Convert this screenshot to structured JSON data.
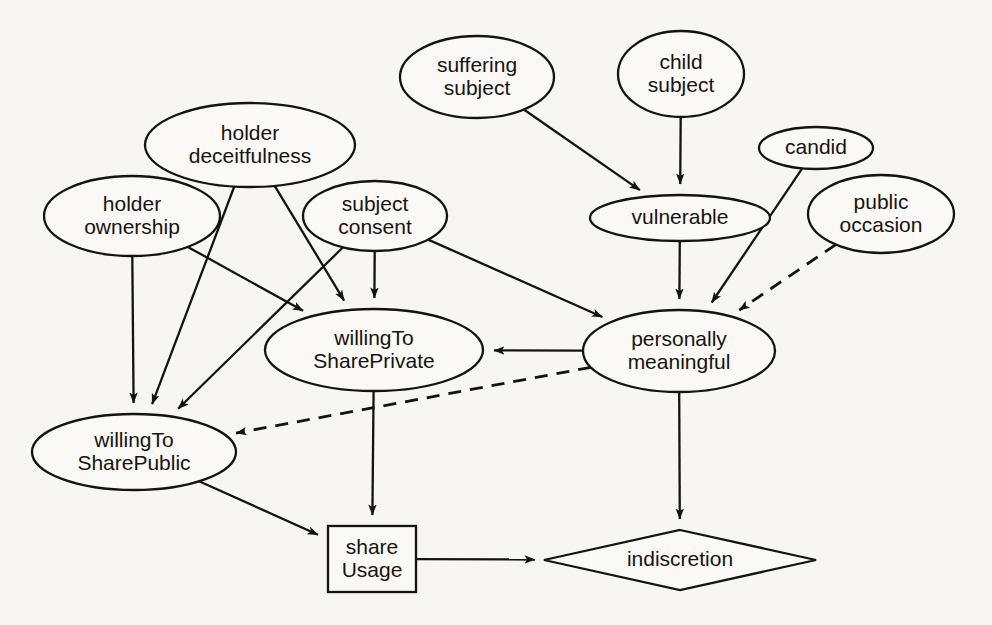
{
  "diagram": {
    "background_color": "#f7f6f3",
    "stroke_color": "#16130f",
    "node_fill": "#faf9f6",
    "nodes": [
      {
        "id": "suffering_subject",
        "label_lines": [
          "suffering",
          "subject"
        ],
        "shape": "ellipse",
        "cx": 477,
        "cy": 77,
        "rx": 77,
        "ry": 41
      },
      {
        "id": "child_subject",
        "label_lines": [
          "child",
          "subject"
        ],
        "shape": "ellipse",
        "cx": 681,
        "cy": 74,
        "rx": 63,
        "ry": 43
      },
      {
        "id": "holder_deceitfulness",
        "label_lines": [
          "holder",
          "deceitfulness"
        ],
        "shape": "ellipse",
        "cx": 250,
        "cy": 145,
        "rx": 105,
        "ry": 42
      },
      {
        "id": "candid",
        "label_lines": [
          "candid"
        ],
        "shape": "ellipse",
        "cx": 816,
        "cy": 148,
        "rx": 57,
        "ry": 21
      },
      {
        "id": "holder_ownership",
        "label_lines": [
          "holder",
          "ownership"
        ],
        "shape": "ellipse",
        "cx": 132,
        "cy": 216,
        "rx": 88,
        "ry": 40
      },
      {
        "id": "subject_consent",
        "label_lines": [
          "subject",
          "consent"
        ],
        "shape": "ellipse",
        "cx": 375,
        "cy": 216,
        "rx": 72,
        "ry": 35
      },
      {
        "id": "vulnerable",
        "label_lines": [
          "vulnerable"
        ],
        "shape": "ellipse",
        "cx": 680,
        "cy": 218,
        "rx": 90,
        "ry": 23
      },
      {
        "id": "public_occasion",
        "label_lines": [
          "public",
          "occasion"
        ],
        "shape": "ellipse",
        "cx": 881,
        "cy": 214,
        "rx": 73,
        "ry": 39
      },
      {
        "id": "willing_share_private",
        "label_lines": [
          "willingTo",
          "SharePrivate"
        ],
        "shape": "ellipse",
        "cx": 374,
        "cy": 350,
        "rx": 109,
        "ry": 41
      },
      {
        "id": "personally_meaningful",
        "label_lines": [
          "personally",
          "meaningful"
        ],
        "shape": "ellipse",
        "cx": 679,
        "cy": 351,
        "rx": 96,
        "ry": 41
      },
      {
        "id": "willing_share_public",
        "label_lines": [
          "willingTo",
          "SharePublic"
        ],
        "shape": "ellipse",
        "cx": 134,
        "cy": 452,
        "rx": 102,
        "ry": 38
      },
      {
        "id": "share_usage",
        "label_lines": [
          "share",
          "Usage"
        ],
        "shape": "rect",
        "cx": 372,
        "cy": 559,
        "rx": 44,
        "ry": 33
      },
      {
        "id": "indiscretion",
        "label_lines": [
          "indiscretion"
        ],
        "shape": "diamond",
        "cx": 680,
        "cy": 560,
        "rx": 136,
        "ry": 30
      }
    ],
    "edges": [
      {
        "from": "suffering_subject",
        "to": "vulnerable",
        "style": "solid",
        "arrow": true
      },
      {
        "from": "child_subject",
        "to": "vulnerable",
        "style": "solid",
        "arrow": true
      },
      {
        "from": "vulnerable",
        "to": "personally_meaningful",
        "style": "solid",
        "arrow": true
      },
      {
        "from": "candid",
        "to": "personally_meaningful",
        "style": "solid",
        "arrow": true
      },
      {
        "from": "public_occasion",
        "to": "personally_meaningful",
        "style": "dashed",
        "arrow": true
      },
      {
        "from": "holder_deceitfulness",
        "to": "willing_share_private",
        "style": "solid",
        "arrow": true
      },
      {
        "from": "holder_deceitfulness",
        "to": "willing_share_public",
        "style": "solid",
        "arrow": true
      },
      {
        "from": "holder_ownership",
        "to": "willing_share_public",
        "style": "solid",
        "arrow": true
      },
      {
        "from": "holder_ownership",
        "to": "willing_share_private",
        "style": "solid",
        "arrow": true
      },
      {
        "from": "subject_consent",
        "to": "willing_share_private",
        "style": "solid",
        "arrow": true
      },
      {
        "from": "subject_consent",
        "to": "willing_share_public",
        "style": "solid",
        "arrow": true
      },
      {
        "from": "subject_consent",
        "to": "personally_meaningful",
        "style": "solid",
        "arrow": true
      },
      {
        "from": "personally_meaningful",
        "to": "willing_share_private",
        "style": "solid",
        "arrow": true
      },
      {
        "from": "personally_meaningful",
        "to": "willing_share_public",
        "style": "dashed",
        "arrow": true
      },
      {
        "from": "personally_meaningful",
        "to": "indiscretion",
        "style": "solid",
        "arrow": true
      },
      {
        "from": "willing_share_private",
        "to": "share_usage",
        "style": "solid",
        "arrow": true
      },
      {
        "from": "willing_share_public",
        "to": "share_usage",
        "style": "solid",
        "arrow": true
      },
      {
        "from": "share_usage",
        "to": "indiscretion",
        "style": "solid",
        "arrow": true
      }
    ]
  }
}
